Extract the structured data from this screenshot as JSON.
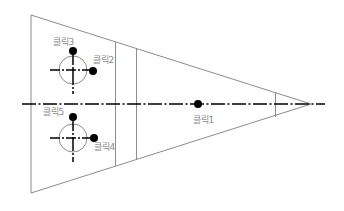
{
  "diagram": {
    "type": "technical-drawing",
    "colors": {
      "outline": "#8c8c8c",
      "centerline": "#000000",
      "crosshair": "#000000",
      "circle": "#8c8c8c",
      "dot": "#000000",
      "label": "#8a8a8a"
    },
    "outline": {
      "top_left": [
        31,
        15
      ],
      "bottom_left": [
        31,
        193
      ],
      "tip": [
        311,
        104
      ]
    },
    "centerline": {
      "y": 104,
      "x_start": 22,
      "x_end": 325
    },
    "vertical_lines": [
      {
        "x": 115,
        "y1": 42,
        "y2": 166
      },
      {
        "x": 136,
        "y1": 48,
        "y2": 160
      },
      {
        "x": 275,
        "y1": 92,
        "y2": 117
      }
    ],
    "circles": [
      {
        "name": "upper-circle",
        "cx": 73,
        "cy": 70,
        "r": 14
      },
      {
        "name": "lower-circle",
        "cx": 73,
        "cy": 138,
        "r": 14
      }
    ],
    "points": [
      {
        "id": 1,
        "label": "클릭1",
        "x": 198,
        "y": 104,
        "label_x": 193,
        "label_y": 115
      },
      {
        "id": 2,
        "label": "클릭2",
        "x": 93,
        "y": 71,
        "label_x": 93,
        "label_y": 55
      },
      {
        "id": 3,
        "label": "클릭3",
        "x": 73,
        "y": 51,
        "label_x": 53,
        "label_y": 37
      },
      {
        "id": 4,
        "label": "클릭4",
        "x": 94,
        "y": 138,
        "label_x": 94,
        "label_y": 142
      },
      {
        "id": 5,
        "label": "클릭5",
        "x": 73,
        "y": 117,
        "label_x": 43,
        "label_y": 107
      }
    ]
  },
  "labels": {
    "click1": "클릭1",
    "click2": "클릭2",
    "click3": "클릭3",
    "click4": "클릭4",
    "click5": "클릭5"
  }
}
